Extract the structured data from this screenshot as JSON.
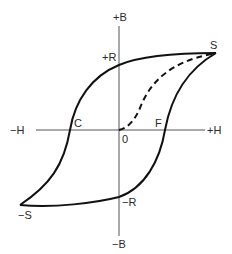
{
  "diagram": {
    "axes": {
      "vertical_pos_label": "+B",
      "vertical_neg_label": "−B",
      "horizontal_pos_label": "+H",
      "horizontal_neg_label": "−H",
      "origin_label": "0"
    },
    "points": {
      "saturation_pos": "S",
      "saturation_neg": "−S",
      "remanence_pos": "+R",
      "remanence_neg": "−R",
      "coercive_neg": "C",
      "coercive_pos": "F"
    },
    "colors": {
      "curve": "#111111",
      "axis": "#555555",
      "text": "#2a2a2a"
    }
  }
}
